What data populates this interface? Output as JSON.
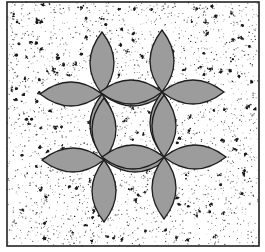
{
  "figure": {
    "frame": {
      "x": 7,
      "y": 2,
      "width": 252,
      "height": 244,
      "stroke": "#222222"
    },
    "background": {
      "fill": "#ffffff",
      "speckle_color": "#1a1a1a"
    },
    "petal_style": {
      "fill": "#9c9c9c",
      "stroke": "#1e1e1e",
      "length": 62,
      "half_width": 12
    },
    "rosettes": [
      {
        "name": "top-left",
        "cx": 102,
        "cy": 94
      },
      {
        "name": "top-right",
        "cx": 162,
        "cy": 92
      },
      {
        "name": "bottom-left",
        "cx": 104,
        "cy": 160
      },
      {
        "name": "bottom-right",
        "cx": 164,
        "cy": 157
      }
    ]
  }
}
